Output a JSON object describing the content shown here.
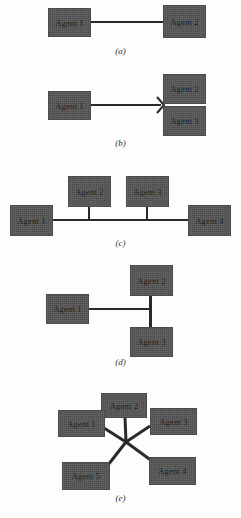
{
  "document": {
    "title": "Agent network topology configurations",
    "background_color": "#fdfdfd",
    "node_fill_color": "#565656",
    "link_color": "#2a2a2a",
    "text_color": "#141414"
  },
  "figures": [
    {
      "id": "a",
      "caption": "(a)",
      "topology": "point-to-point",
      "nodes": [
        {
          "label": "Agent 1"
        },
        {
          "label": "Agent 2"
        }
      ]
    },
    {
      "id": "b",
      "caption": "(b)",
      "topology": "branching",
      "nodes": [
        {
          "label": "Agent 1"
        },
        {
          "label": "Agent 2"
        },
        {
          "label": "Agent 3"
        }
      ]
    },
    {
      "id": "c",
      "caption": "(c)",
      "topology": "bus",
      "nodes": [
        {
          "label": "Agent 1"
        },
        {
          "label": "Agent 2"
        },
        {
          "label": "Agent 3"
        },
        {
          "label": "Agent 4"
        }
      ]
    },
    {
      "id": "d",
      "caption": "(d)",
      "topology": "tee",
      "nodes": [
        {
          "label": "Agent 1"
        },
        {
          "label": "Agent 2"
        },
        {
          "label": "Agent 3"
        }
      ]
    },
    {
      "id": "e",
      "caption": "(e)",
      "topology": "star-mesh",
      "nodes": [
        {
          "label": "Agent 1"
        },
        {
          "label": "Agent 2"
        },
        {
          "label": "Agent 3"
        },
        {
          "label": "Agent 4"
        },
        {
          "label": "Agent 5"
        }
      ]
    }
  ]
}
